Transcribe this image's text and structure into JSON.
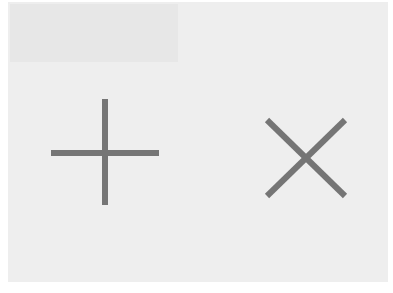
{
  "canvas": {
    "background": "#ffffff",
    "card_color": "#eeeeee",
    "shade_color": "#e7e7e7"
  },
  "icons": [
    {
      "name": "plus-icon",
      "label": "Add",
      "symbol": "+",
      "color": "#757575"
    },
    {
      "name": "close-icon",
      "label": "Close",
      "symbol": "×",
      "color": "#757575"
    }
  ]
}
